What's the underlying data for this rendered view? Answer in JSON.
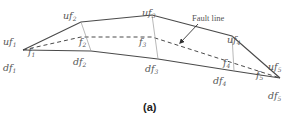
{
  "figure": {
    "caption": "(a)",
    "annotation": "Fault line",
    "colors": {
      "line": "#4a4a4a",
      "thin": "#9a9a9a",
      "text": "#555555"
    }
  },
  "labels": {
    "uf1": {
      "base": "uf",
      "sub": "1"
    },
    "uf2": {
      "base": "uf",
      "sub": "2"
    },
    "uf3": {
      "base": "uf",
      "sub": "3"
    },
    "uf4": {
      "base": "uf",
      "sub": "4"
    },
    "uf5": {
      "base": "uf",
      "sub": "5"
    },
    "df1": {
      "base": "df",
      "sub": "1"
    },
    "df2": {
      "base": "df",
      "sub": "2"
    },
    "df3": {
      "base": "df",
      "sub": "3"
    },
    "df4": {
      "base": "df",
      "sub": "4"
    },
    "df5": {
      "base": "df",
      "sub": "5"
    },
    "f1": {
      "base": "f",
      "sub": "1"
    },
    "f2": {
      "base": "f",
      "sub": "2"
    },
    "f3": {
      "base": "f",
      "sub": "3"
    },
    "f4": {
      "base": "f",
      "sub": "4"
    },
    "f5": {
      "base": "f",
      "sub": "5"
    }
  }
}
